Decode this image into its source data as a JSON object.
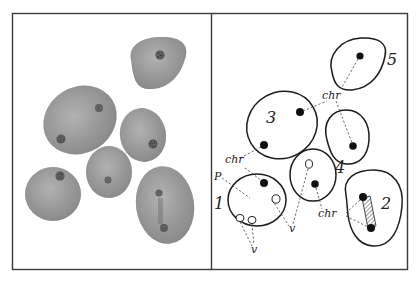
{
  "figure": {
    "left_panel": {
      "description": "Photomicrograph of six stained cell nuclei",
      "cells": [
        {
          "id": "top",
          "chromocenters": 1
        },
        {
          "id": "large-left",
          "chromocenters": 2
        },
        {
          "id": "middle-right",
          "chromocenters": 1
        },
        {
          "id": "center",
          "chromocenters": 1
        },
        {
          "id": "bottom-left",
          "chromocenters": 1
        },
        {
          "id": "bottom-right",
          "chromocenters": 2
        }
      ]
    },
    "right_panel": {
      "description": "Interpretive line drawing of the same nuclei",
      "cell_numbers": {
        "n1": "1",
        "n2": "2",
        "n3": "3",
        "n4": "4",
        "n5": "5"
      },
      "labels": {
        "chr_top": "chr",
        "chr_left": "chr",
        "chr_bottom": "chr",
        "p": "P",
        "v_center": "v",
        "v_bottom": "v"
      }
    }
  },
  "colors": {
    "frame": "#3a3a3a",
    "ink": "#1c1c1c",
    "cell_fill": "#9a9a9a",
    "chromocenter": "#1a1a1a",
    "background": "#ffffff"
  }
}
